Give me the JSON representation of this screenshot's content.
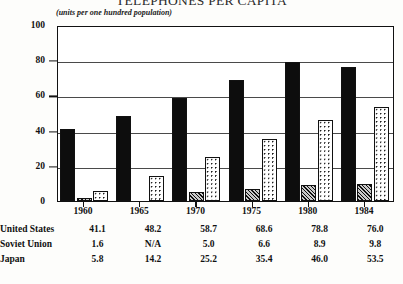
{
  "chart_data": {
    "type": "bar",
    "title": "TELEPHONES PER CAPITA",
    "subtitle": "(units per one hundred population)",
    "xlabel": "",
    "ylabel": "",
    "ylim": [
      0,
      100
    ],
    "yticks": [
      0,
      20,
      40,
      60,
      80,
      100
    ],
    "grid": true,
    "legend": "none",
    "categories": [
      "1960",
      "1965",
      "1970",
      "1975",
      "1980",
      "1984"
    ],
    "series": [
      {
        "name": "United States",
        "pattern": "solid-black",
        "values": [
          41.1,
          48.2,
          58.7,
          68.6,
          78.8,
          76.0
        ],
        "labels": [
          "41.1",
          "48.2",
          "58.7",
          "68.6",
          "78.8",
          "76.0"
        ]
      },
      {
        "name": "Soviet Union",
        "pattern": "diagonal-hatch",
        "values": [
          1.6,
          null,
          5.0,
          6.6,
          8.9,
          9.8
        ],
        "labels": [
          "1.6",
          "N/A",
          "5.0",
          "6.6",
          "8.9",
          "9.8"
        ]
      },
      {
        "name": "Japan",
        "pattern": "dotted",
        "values": [
          5.8,
          14.2,
          25.2,
          35.4,
          46.0,
          53.5
        ],
        "labels": [
          "5.8",
          "14.2",
          "25.2",
          "35.4",
          "46.0",
          "53.5"
        ]
      }
    ]
  }
}
